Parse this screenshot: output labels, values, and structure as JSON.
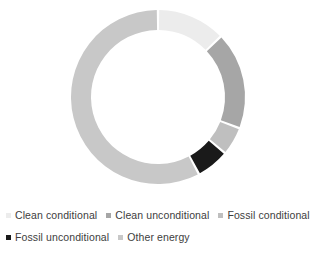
{
  "chart_data": {
    "type": "pie",
    "variant": "donut",
    "title": "",
    "subtitle": "",
    "xlabel": "",
    "ylabel": "",
    "legend_position": "bottom",
    "grid": false,
    "start_angle_deg": 0,
    "direction": "clockwise",
    "inner_radius_ratio": 0.77,
    "categories": [
      "Clean conditional",
      "Clean unconditional",
      "Fossil conditional",
      "Fossil unconditional",
      "Other energy"
    ],
    "values": [
      12.8,
      18.1,
      5.3,
      6.1,
      57.7
    ],
    "units": "percent",
    "slice_angles_deg": [
      46,
      65,
      19,
      22,
      208
    ],
    "colors": [
      "#ECECEC",
      "#A6A6A6",
      "#BFBFBF",
      "#1A1A1A",
      "#C8C8C8"
    ],
    "slices": [
      {
        "label": "Clean conditional",
        "value": 12.8,
        "color": "#ECECEC",
        "start_deg": 0,
        "end_deg": 46
      },
      {
        "label": "Clean unconditional",
        "value": 18.1,
        "color": "#A6A6A6",
        "start_deg": 46,
        "end_deg": 111
      },
      {
        "label": "Fossil conditional",
        "value": 5.3,
        "color": "#BFBFBF",
        "start_deg": 111,
        "end_deg": 130
      },
      {
        "label": "Fossil unconditional",
        "value": 6.1,
        "color": "#1A1A1A",
        "start_deg": 130,
        "end_deg": 152
      },
      {
        "label": "Other energy",
        "value": 57.7,
        "color": "#C8C8C8",
        "start_deg": 152,
        "end_deg": 360
      }
    ]
  },
  "legend": {
    "rows": [
      [
        {
          "label": "Clean conditional",
          "color": "#ECECEC"
        },
        {
          "label": "Clean unconditional",
          "color": "#A6A6A6"
        },
        {
          "label": "Fossil conditional",
          "color": "#BFBFBF"
        }
      ],
      [
        {
          "label": "Fossil unconditional",
          "color": "#1A1A1A"
        },
        {
          "label": "Other energy",
          "color": "#C8C8C8"
        }
      ]
    ]
  },
  "geometry": {
    "center_x": 158,
    "center_y": 97,
    "outer_radius": 87,
    "inner_radius": 67,
    "gap_deg": 1.6,
    "background": "#FFFFFF"
  }
}
